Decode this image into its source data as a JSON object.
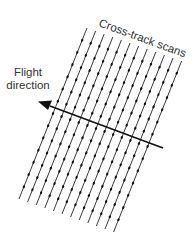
{
  "diagram": {
    "title_label": "Cross-track scans",
    "flight_label_line1": "Flight",
    "flight_label_line2": "direction",
    "scan_line_count": 12,
    "colors": {
      "line": "#222222",
      "dot": "#111111",
      "text": "#333333",
      "background": "#ffffff"
    }
  }
}
